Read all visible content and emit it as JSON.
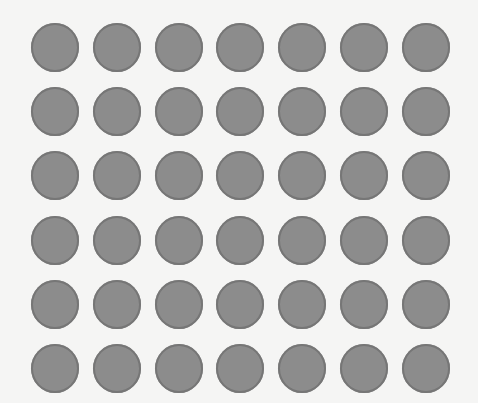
{
  "grid": {
    "rows": 6,
    "cols": 7,
    "col_centers": [
      55,
      117,
      179,
      240,
      302,
      364,
      426
    ],
    "row_centers": [
      47,
      111,
      175,
      240,
      304,
      368
    ],
    "diameter": 48,
    "fill_color": "#8c8c8c",
    "edge_color": "#767676",
    "background_color": "#f5f5f4"
  }
}
